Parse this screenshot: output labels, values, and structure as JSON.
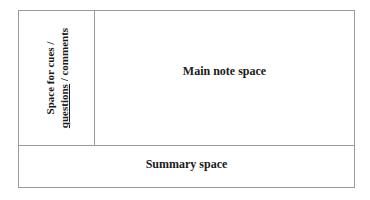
{
  "diagram": {
    "type": "cornell-notes-layout",
    "cue_column": {
      "line1": "Space for cues /",
      "line2_underlined": "questions",
      "line2_rest": " / comments"
    },
    "main_area": {
      "label": "Main note space"
    },
    "summary_area": {
      "label": "Summary space"
    },
    "colors": {
      "border": "#9a9a9a",
      "text": "#1a1a1a",
      "background": "#ffffff"
    }
  }
}
